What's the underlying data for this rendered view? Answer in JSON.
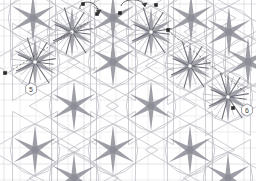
{
  "app": {
    "title": "Geometric Pattern Canvas",
    "canvas_name": "tessellation-canvas",
    "width": 256,
    "height": 181
  },
  "colors": {
    "background": "#ffffff",
    "grid_line": "#e2e2e6",
    "grid_major": "#d2d2d8",
    "tile_outline": "#b9b9c2",
    "ray_dark": "#6e6e78",
    "ray_mid": "#8d8d97",
    "ray_light": "#a9a9b2",
    "annotation": "#3a3a3a",
    "marker_fill": "#2b2b2b",
    "badge_stroke": "#7a7a82"
  },
  "grid": {
    "visible": true,
    "cell_size": 16,
    "origin_x": 4,
    "origin_y": 4,
    "columns": 16,
    "rows": 11
  },
  "pattern": {
    "type": "hexagon-diamond-tessellation",
    "motif": "six-pointed-star",
    "star_spacing_x": 78,
    "star_spacing_y": 88,
    "stars": [
      {
        "id": "star-1",
        "cx": 33,
        "cy": 18,
        "rays": 6,
        "state": "partial"
      },
      {
        "id": "star-2",
        "cx": 72,
        "cy": 32,
        "rays": 12,
        "state": "selected"
      },
      {
        "id": "star-3",
        "cx": 113,
        "cy": 18,
        "rays": 6,
        "state": "partial"
      },
      {
        "id": "star-4",
        "cx": 151,
        "cy": 32,
        "rays": 12,
        "state": "selected"
      },
      {
        "id": "star-5",
        "cx": 191,
        "cy": 18,
        "rays": 6,
        "state": "partial"
      },
      {
        "id": "star-6",
        "cx": 229,
        "cy": 32,
        "rays": 6,
        "state": "normal"
      },
      {
        "id": "star-7",
        "cx": 35,
        "cy": 62,
        "rays": 12,
        "state": "selected"
      },
      {
        "id": "star-8",
        "cx": 113,
        "cy": 62,
        "rays": 6,
        "state": "normal"
      },
      {
        "id": "star-9",
        "cx": 190,
        "cy": 66,
        "rays": 12,
        "state": "selected"
      },
      {
        "id": "star-10",
        "cx": 74,
        "cy": 106,
        "rays": 6,
        "state": "normal"
      },
      {
        "id": "star-11",
        "cx": 151,
        "cy": 106,
        "rays": 6,
        "state": "normal"
      },
      {
        "id": "star-12",
        "cx": 228,
        "cy": 97,
        "rays": 12,
        "state": "selected"
      },
      {
        "id": "star-13",
        "cx": 35,
        "cy": 150,
        "rays": 6,
        "state": "normal"
      },
      {
        "id": "star-14",
        "cx": 113,
        "cy": 150,
        "rays": 6,
        "state": "normal"
      },
      {
        "id": "star-15",
        "cx": 190,
        "cy": 150,
        "rays": 6,
        "state": "normal"
      },
      {
        "id": "star-16",
        "cx": 248,
        "cy": 62,
        "rays": 6,
        "state": "edge"
      },
      {
        "id": "star-17",
        "cx": 74,
        "cy": 178,
        "rays": 6,
        "state": "edge"
      },
      {
        "id": "star-18",
        "cx": 228,
        "cy": 178,
        "rays": 6,
        "state": "edge"
      }
    ]
  },
  "annotations": {
    "badges": [
      {
        "id": "badge-5",
        "label": "5",
        "x": 31,
        "y": 89
      },
      {
        "id": "badge-6",
        "label": "6",
        "x": 247,
        "y": 110
      }
    ],
    "handles": [
      {
        "id": "handle-a",
        "x": 83,
        "y": 4
      },
      {
        "id": "handle-b",
        "x": 97,
        "y": 14
      },
      {
        "id": "handle-c",
        "x": 120,
        "y": 13
      },
      {
        "id": "handle-d",
        "x": 156,
        "y": 5
      },
      {
        "id": "handle-e",
        "x": 5,
        "y": 73
      },
      {
        "id": "handle-f",
        "x": 168,
        "y": 30
      },
      {
        "id": "handle-g",
        "x": 233,
        "y": 108
      }
    ],
    "rotation_arrows": [
      {
        "id": "rotation-arrow-left",
        "cx": 90,
        "cy": 10,
        "direction": "counter-clockwise"
      },
      {
        "id": "rotation-arrow-right",
        "cx": 137,
        "cy": 9,
        "direction": "clockwise"
      }
    ],
    "guide_lines": [
      {
        "id": "guide-diagonal",
        "x1": 6,
        "y1": 74,
        "x2": 88,
        "y2": 22,
        "style": "dashed"
      },
      {
        "id": "guide-diagonal-2",
        "x1": 168,
        "y1": 31,
        "x2": 245,
        "y2": 92,
        "style": "dashed"
      }
    ]
  }
}
